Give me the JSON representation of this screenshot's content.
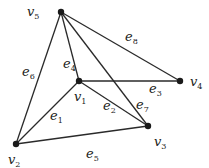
{
  "graph": {
    "vertices": [
      {
        "id": "v5",
        "name": "v",
        "sub": "5",
        "x": 61,
        "y": 12,
        "lx": 27,
        "ly": 16
      },
      {
        "id": "v1",
        "name": "v",
        "sub": "1",
        "x": 79,
        "y": 81,
        "lx": 74,
        "ly": 101
      },
      {
        "id": "v4",
        "name": "v",
        "sub": "4",
        "x": 180,
        "y": 81,
        "lx": 190,
        "ly": 86
      },
      {
        "id": "v3",
        "name": "v",
        "sub": "3",
        "x": 148,
        "y": 126,
        "lx": 154,
        "ly": 146
      },
      {
        "id": "v2",
        "name": "v",
        "sub": "2",
        "x": 16,
        "y": 144,
        "lx": 8,
        "ly": 164
      }
    ],
    "edges": [
      {
        "id": "e6",
        "from": "v5",
        "to": "v2",
        "name": "e",
        "sub": "6",
        "lx": 22,
        "ly": 76
      },
      {
        "id": "e4",
        "from": "v5",
        "to": "v1",
        "name": "e",
        "sub": "4",
        "lx": 63,
        "ly": 68
      },
      {
        "id": "e8",
        "from": "v5",
        "to": "v4",
        "name": "e",
        "sub": "8",
        "lx": 125,
        "ly": 41
      },
      {
        "id": "e7",
        "from": "v5",
        "to": "v3",
        "name": "e",
        "sub": "7",
        "lx": 136,
        "ly": 109
      },
      {
        "id": "e3",
        "from": "v1",
        "to": "v4",
        "name": "e",
        "sub": "3",
        "lx": 149,
        "ly": 93
      },
      {
        "id": "e2",
        "from": "v1",
        "to": "v3",
        "name": "e",
        "sub": "2",
        "lx": 103,
        "ly": 110
      },
      {
        "id": "e1",
        "from": "v1",
        "to": "v2",
        "name": "e",
        "sub": "1",
        "lx": 50,
        "ly": 120
      },
      {
        "id": "e5",
        "from": "v2",
        "to": "v3",
        "name": "e",
        "sub": "5",
        "lx": 86,
        "ly": 158
      }
    ]
  }
}
